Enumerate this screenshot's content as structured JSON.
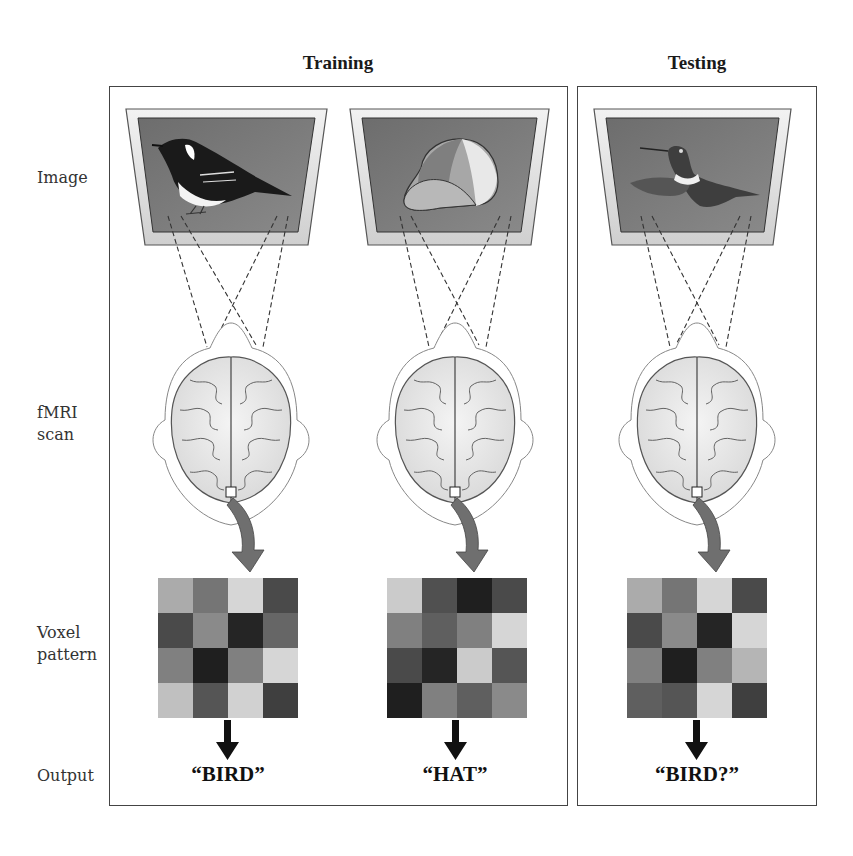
{
  "sections": {
    "training": {
      "title": "Training"
    },
    "testing": {
      "title": "Testing"
    }
  },
  "row_labels": {
    "image": "Image",
    "fmri_line1": "fMRI",
    "fmri_line2": "scan",
    "voxel_line1": "Voxel",
    "voxel_line2": "pattern",
    "output": "Output"
  },
  "columns": [
    {
      "id": "train-bird",
      "section": "training",
      "stimulus": "bird",
      "output": "“BIRD”",
      "voxel_darkness": [
        [
          0.3,
          0.55,
          0.1,
          0.75
        ],
        [
          0.75,
          0.45,
          0.92,
          0.62
        ],
        [
          0.5,
          0.95,
          0.5,
          0.1
        ],
        [
          0.2,
          0.7,
          0.12,
          0.8
        ]
      ]
    },
    {
      "id": "train-hat",
      "section": "training",
      "stimulus": "hat",
      "output": "“HAT”",
      "voxel_darkness": [
        [
          0.15,
          0.72,
          0.95,
          0.75
        ],
        [
          0.5,
          0.65,
          0.5,
          0.1
        ],
        [
          0.75,
          0.92,
          0.15,
          0.7
        ],
        [
          0.95,
          0.5,
          0.65,
          0.45
        ]
      ]
    },
    {
      "id": "test-hummingbird",
      "section": "testing",
      "stimulus": "hummingbird",
      "output": "“BIRD?”",
      "voxel_darkness": [
        [
          0.3,
          0.55,
          0.1,
          0.75
        ],
        [
          0.75,
          0.45,
          0.92,
          0.1
        ],
        [
          0.5,
          0.95,
          0.5,
          0.25
        ],
        [
          0.65,
          0.7,
          0.1,
          0.8
        ]
      ]
    }
  ],
  "colors": {
    "screen": "#7a7a7a",
    "monitor_frame": "#e2e2e2",
    "arrow_gray": "#6f6f6f",
    "arrow_black": "#111111",
    "box_border": "#444444"
  }
}
